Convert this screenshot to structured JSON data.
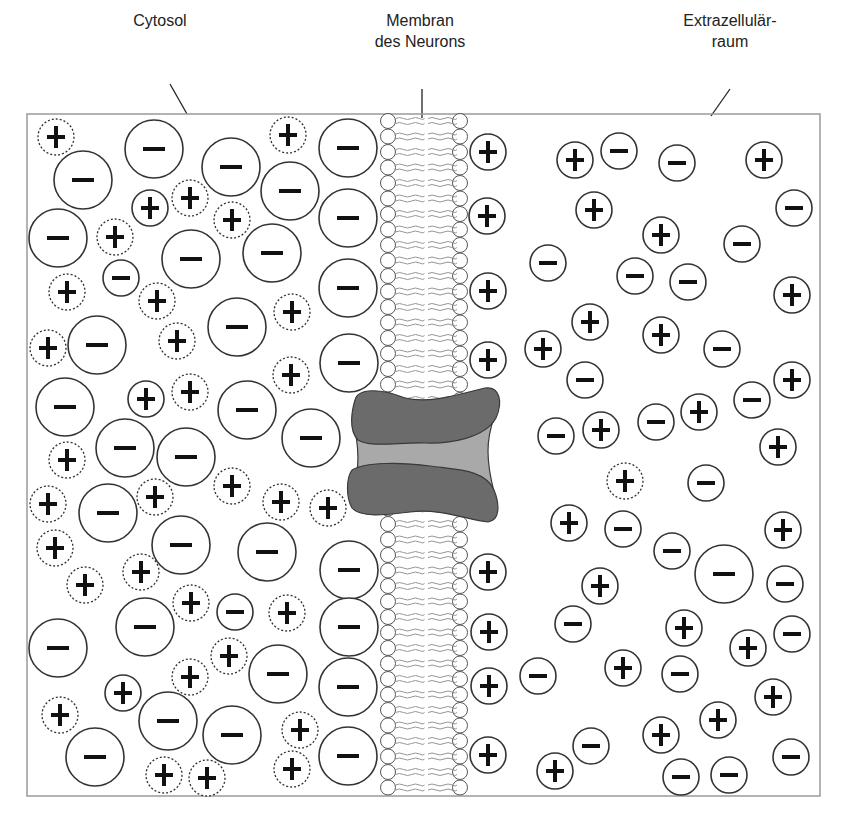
{
  "labels": {
    "cytosol": "Cytosol",
    "membrane_line1": "Membran",
    "membrane_line2": "des Neurons",
    "extracellular_line1": "Extrazellulär-",
    "extracellular_line2": "raum"
  },
  "colors": {
    "stroke": "#333333",
    "box_border": "#9a9a9a",
    "lipid_tail": "#8a8a8a",
    "channel_dark": "#6b6b6b",
    "channel_light": "#a9a9a9",
    "channel_outline": "#3a3a3a"
  },
  "box": {
    "x": 27,
    "y": 114,
    "width": 793,
    "height": 682
  },
  "membrane": {
    "left_head_x": 388,
    "right_head_x": 460,
    "head_r": 7.5,
    "spacing": 15.5,
    "top": 121,
    "bottom": 790,
    "gap_top": 388,
    "gap_bottom": 508
  },
  "cytosol_ions": [
    {
      "t": "cd",
      "x": 56,
      "y": 137
    },
    {
      "t": "a",
      "x": 83,
      "y": 180,
      "r": 29
    },
    {
      "t": "a",
      "x": 154,
      "y": 149,
      "r": 29
    },
    {
      "t": "a",
      "x": 231,
      "y": 167,
      "r": 29
    },
    {
      "t": "cd",
      "x": 288,
      "y": 135
    },
    {
      "t": "a",
      "x": 290,
      "y": 191,
      "r": 29
    },
    {
      "t": "a",
      "x": 348,
      "y": 148,
      "r": 29
    },
    {
      "t": "cs",
      "x": 150,
      "y": 208
    },
    {
      "t": "cd",
      "x": 190,
      "y": 198
    },
    {
      "t": "cd",
      "x": 232,
      "y": 220
    },
    {
      "t": "a",
      "x": 58,
      "y": 238,
      "r": 29
    },
    {
      "t": "cd",
      "x": 115,
      "y": 237
    },
    {
      "t": "a",
      "x": 191,
      "y": 259,
      "r": 29
    },
    {
      "t": "a",
      "x": 272,
      "y": 253,
      "r": 29
    },
    {
      "t": "a",
      "x": 348,
      "y": 218,
      "r": 29
    },
    {
      "t": "cs",
      "x": 121,
      "y": 278,
      "neg": true
    },
    {
      "t": "cd",
      "x": 67,
      "y": 292
    },
    {
      "t": "cd",
      "x": 157,
      "y": 301
    },
    {
      "t": "cd",
      "x": 292,
      "y": 312
    },
    {
      "t": "a",
      "x": 237,
      "y": 327,
      "r": 29
    },
    {
      "t": "a",
      "x": 348,
      "y": 288,
      "r": 29
    },
    {
      "t": "cd",
      "x": 48,
      "y": 348
    },
    {
      "t": "a",
      "x": 97,
      "y": 345,
      "r": 29
    },
    {
      "t": "cd",
      "x": 177,
      "y": 341
    },
    {
      "t": "cd",
      "x": 291,
      "y": 375
    },
    {
      "t": "a",
      "x": 349,
      "y": 363,
      "r": 29
    },
    {
      "t": "a",
      "x": 65,
      "y": 407,
      "r": 29
    },
    {
      "t": "cs",
      "x": 146,
      "y": 399
    },
    {
      "t": "cd",
      "x": 190,
      "y": 392
    },
    {
      "t": "a",
      "x": 247,
      "y": 410,
      "r": 29
    },
    {
      "t": "a",
      "x": 311,
      "y": 438,
      "r": 29
    },
    {
      "t": "cd",
      "x": 67,
      "y": 460
    },
    {
      "t": "a",
      "x": 125,
      "y": 448,
      "r": 29
    },
    {
      "t": "a",
      "x": 186,
      "y": 457,
      "r": 29
    },
    {
      "t": "cd",
      "x": 232,
      "y": 486
    },
    {
      "t": "cd",
      "x": 281,
      "y": 502
    },
    {
      "t": "cd",
      "x": 328,
      "y": 508
    },
    {
      "t": "cd",
      "x": 48,
      "y": 504
    },
    {
      "t": "cd",
      "x": 155,
      "y": 497
    },
    {
      "t": "a",
      "x": 108,
      "y": 513,
      "r": 29
    },
    {
      "t": "a",
      "x": 181,
      "y": 545,
      "r": 29
    },
    {
      "t": "a",
      "x": 267,
      "y": 552,
      "r": 29
    },
    {
      "t": "cd",
      "x": 55,
      "y": 548
    },
    {
      "t": "cd",
      "x": 141,
      "y": 572
    },
    {
      "t": "cd",
      "x": 85,
      "y": 585
    },
    {
      "t": "a",
      "x": 349,
      "y": 570,
      "r": 29
    },
    {
      "t": "cd",
      "x": 191,
      "y": 603
    },
    {
      "t": "cs",
      "x": 235,
      "y": 612,
      "neg": true
    },
    {
      "t": "cd",
      "x": 287,
      "y": 613
    },
    {
      "t": "a",
      "x": 145,
      "y": 627,
      "r": 29
    },
    {
      "t": "a",
      "x": 349,
      "y": 627,
      "r": 29
    },
    {
      "t": "a",
      "x": 58,
      "y": 648,
      "r": 29
    },
    {
      "t": "cd",
      "x": 229,
      "y": 656
    },
    {
      "t": "cd",
      "x": 190,
      "y": 677
    },
    {
      "t": "a",
      "x": 278,
      "y": 674,
      "r": 29
    },
    {
      "t": "a",
      "x": 348,
      "y": 687,
      "r": 29
    },
    {
      "t": "cs",
      "x": 123,
      "y": 693
    },
    {
      "t": "cd",
      "x": 60,
      "y": 715
    },
    {
      "t": "a",
      "x": 168,
      "y": 721,
      "r": 29
    },
    {
      "t": "a",
      "x": 232,
      "y": 735,
      "r": 29
    },
    {
      "t": "cd",
      "x": 300,
      "y": 730
    },
    {
      "t": "a",
      "x": 348,
      "y": 756,
      "r": 29
    },
    {
      "t": "a",
      "x": 95,
      "y": 757,
      "r": 29
    },
    {
      "t": "cd",
      "x": 164,
      "y": 775
    },
    {
      "t": "cd",
      "x": 207,
      "y": 778
    },
    {
      "t": "cd",
      "x": 292,
      "y": 769
    }
  ],
  "extracellular_ions": [
    {
      "t": "c",
      "x": 488,
      "y": 152
    },
    {
      "t": "c",
      "x": 575,
      "y": 160
    },
    {
      "t": "a",
      "x": 619,
      "y": 151
    },
    {
      "t": "a",
      "x": 677,
      "y": 163
    },
    {
      "t": "c",
      "x": 764,
      "y": 160
    },
    {
      "t": "c",
      "x": 487,
      "y": 216
    },
    {
      "t": "c",
      "x": 594,
      "y": 210
    },
    {
      "t": "a",
      "x": 794,
      "y": 208
    },
    {
      "t": "c",
      "x": 661,
      "y": 235
    },
    {
      "t": "a",
      "x": 742,
      "y": 244
    },
    {
      "t": "a",
      "x": 548,
      "y": 263
    },
    {
      "t": "a",
      "x": 635,
      "y": 276
    },
    {
      "t": "a",
      "x": 688,
      "y": 282
    },
    {
      "t": "c",
      "x": 488,
      "y": 291
    },
    {
      "t": "c",
      "x": 792,
      "y": 295
    },
    {
      "t": "c",
      "x": 590,
      "y": 322
    },
    {
      "t": "c",
      "x": 661,
      "y": 335
    },
    {
      "t": "c",
      "x": 543,
      "y": 349
    },
    {
      "t": "a",
      "x": 722,
      "y": 349
    },
    {
      "t": "c",
      "x": 488,
      "y": 360
    },
    {
      "t": "a",
      "x": 585,
      "y": 380
    },
    {
      "t": "c",
      "x": 792,
      "y": 380
    },
    {
      "t": "a",
      "x": 752,
      "y": 400
    },
    {
      "t": "c",
      "x": 699,
      "y": 412
    },
    {
      "t": "a",
      "x": 556,
      "y": 436
    },
    {
      "t": "c",
      "x": 601,
      "y": 430
    },
    {
      "t": "a",
      "x": 656,
      "y": 422
    },
    {
      "t": "c",
      "x": 778,
      "y": 447
    },
    {
      "t": "cd",
      "x": 625,
      "y": 481
    },
    {
      "t": "a",
      "x": 706,
      "y": 483
    },
    {
      "t": "c",
      "x": 569,
      "y": 523
    },
    {
      "t": "a",
      "x": 623,
      "y": 529
    },
    {
      "t": "c",
      "x": 783,
      "y": 530
    },
    {
      "t": "a",
      "x": 672,
      "y": 551
    },
    {
      "t": "a",
      "x": 724,
      "y": 574,
      "r": 29
    },
    {
      "t": "a",
      "x": 785,
      "y": 584
    },
    {
      "t": "c",
      "x": 488,
      "y": 572
    },
    {
      "t": "c",
      "x": 600,
      "y": 586
    },
    {
      "t": "a",
      "x": 573,
      "y": 624
    },
    {
      "t": "c",
      "x": 684,
      "y": 628
    },
    {
      "t": "a",
      "x": 792,
      "y": 634
    },
    {
      "t": "c",
      "x": 748,
      "y": 648
    },
    {
      "t": "c",
      "x": 489,
      "y": 632
    },
    {
      "t": "c",
      "x": 489,
      "y": 686
    },
    {
      "t": "a",
      "x": 538,
      "y": 676
    },
    {
      "t": "c",
      "x": 623,
      "y": 668
    },
    {
      "t": "a",
      "x": 680,
      "y": 674
    },
    {
      "t": "c",
      "x": 773,
      "y": 697
    },
    {
      "t": "c",
      "x": 718,
      "y": 720
    },
    {
      "t": "c",
      "x": 661,
      "y": 735
    },
    {
      "t": "a",
      "x": 591,
      "y": 746
    },
    {
      "t": "a",
      "x": 791,
      "y": 757
    },
    {
      "t": "c",
      "x": 488,
      "y": 755
    },
    {
      "t": "c",
      "x": 555,
      "y": 771
    },
    {
      "t": "a",
      "x": 681,
      "y": 777
    },
    {
      "t": "a",
      "x": 729,
      "y": 775
    }
  ]
}
